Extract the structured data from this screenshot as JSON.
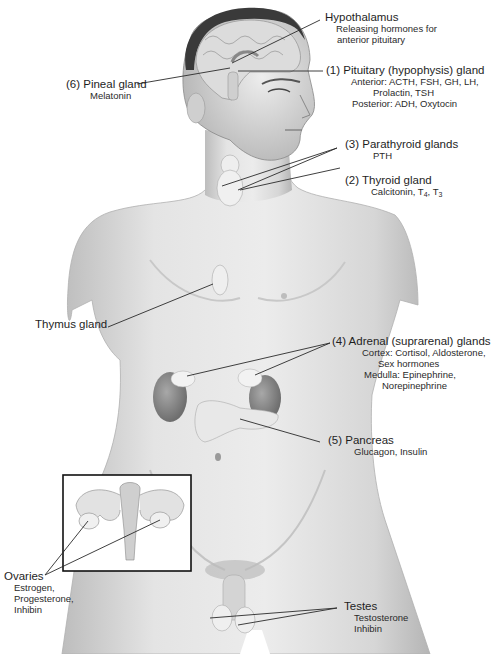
{
  "figure": {
    "colors": {
      "skin_light": "#e6e6e6",
      "skin_mid": "#cfcfcf",
      "skin_shadow": "#9c9c9c",
      "hair": "#3a3a3a",
      "brain": "#d8d8d8",
      "gland": "#f0f0f0",
      "kidney": "#8a8a8a",
      "leader_line": "#2a2a2a",
      "inset_border": "#111111"
    }
  },
  "labels": {
    "hypothalamus": {
      "title": "Hypothalamus",
      "hormones": [
        "Releasing hormones for",
        "anterior pituitary"
      ]
    },
    "pineal": {
      "title": "(6) Pineal gland",
      "hormones": [
        "Melatonin"
      ]
    },
    "pituitary": {
      "title": "(1) Pituitary (hypophysis) gland",
      "hormones": [
        "Anterior: ACTH, FSH, GH, LH,",
        "Prolactin, TSH",
        "Posterior: ADH, Oxytocin"
      ]
    },
    "parathyroid": {
      "title": "(3) Parathyroid glands",
      "hormones": [
        "PTH"
      ]
    },
    "thyroid": {
      "title": "(2) Thyroid gland",
      "hormones_prefix": "Calcitonin, T",
      "t4_sub": "4",
      "sep": ", T",
      "t3_sub": "3"
    },
    "thymus": {
      "title": "Thymus gland"
    },
    "adrenal": {
      "title": "(4) Adrenal (suprarenal) glands",
      "hormones": [
        "Cortex: Cortisol, Aldosterone,",
        "Sex hormones",
        "Medulla: Epinephrine,",
        "Norepinephrine"
      ]
    },
    "pancreas": {
      "title": "(5) Pancreas",
      "hormones": [
        "Glucagon, Insulin"
      ]
    },
    "ovaries": {
      "title": "Ovaries",
      "hormones": [
        "Estrogen,",
        "Progesterone,",
        "Inhibin"
      ]
    },
    "testes": {
      "title": "Testes",
      "hormones": [
        "Testosterone",
        "Inhibin"
      ]
    }
  }
}
